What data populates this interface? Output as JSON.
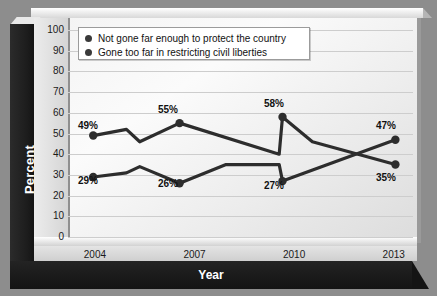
{
  "chart_data": {
    "type": "line",
    "title": "",
    "xlabel": "Year",
    "ylabel": "Percent",
    "ylim": [
      0,
      100
    ],
    "ytick_labels": [
      "100",
      "90",
      "80",
      "70",
      "60",
      "50",
      "40",
      "30",
      "20",
      "10",
      "0"
    ],
    "categories": [
      "2004",
      "2007",
      "2010",
      "2013"
    ],
    "grid": "horizontal",
    "legend_position": "top-left",
    "series": [
      {
        "name": "Not gone far enough to protect the country",
        "color": "#2d2d2d",
        "labeled_values": [
          49,
          55,
          58,
          35
        ],
        "labels": [
          "49%",
          "55%",
          "58%",
          "35%"
        ],
        "points": [
          {
            "x": 2004.3,
            "y": 49
          },
          {
            "x": 2005.3,
            "y": 52
          },
          {
            "x": 2005.7,
            "y": 46
          },
          {
            "x": 2006.9,
            "y": 55
          },
          {
            "x": 2009.9,
            "y": 40
          },
          {
            "x": 2010.0,
            "y": 58
          },
          {
            "x": 2010.9,
            "y": 46
          },
          {
            "x": 2013.4,
            "y": 35
          }
        ]
      },
      {
        "name": "Gone too far in restricting civil liberties",
        "color": "#2d2d2d",
        "labeled_values": [
          29,
          26,
          27,
          47
        ],
        "labels": [
          "29%",
          "26%",
          "27%",
          "47%"
        ],
        "points": [
          {
            "x": 2004.3,
            "y": 29
          },
          {
            "x": 2005.3,
            "y": 31
          },
          {
            "x": 2005.7,
            "y": 34
          },
          {
            "x": 2006.9,
            "y": 26
          },
          {
            "x": 2008.3,
            "y": 35
          },
          {
            "x": 2009.9,
            "y": 35
          },
          {
            "x": 2010.0,
            "y": 27
          },
          {
            "x": 2013.4,
            "y": 47
          }
        ]
      }
    ]
  },
  "legend": {
    "items": [
      {
        "label": "Not gone far enough to protect the country"
      },
      {
        "label": "Gone too far in restricting civil liberties"
      }
    ]
  },
  "axes": {
    "y_title": "Percent",
    "x_title": "Year"
  },
  "data_labels": {
    "upper": [
      {
        "text": "49%",
        "left": 78,
        "top": 120
      },
      {
        "text": "55%",
        "left": 158,
        "top": 104
      },
      {
        "text": "58%",
        "left": 264,
        "top": 98
      },
      {
        "text": "47%",
        "left": 376,
        "top": 120
      }
    ],
    "lower": [
      {
        "text": "29%",
        "left": 78,
        "top": 175
      },
      {
        "text": "26%",
        "left": 158,
        "top": 178
      },
      {
        "text": "27%",
        "left": 264,
        "top": 180
      },
      {
        "text": "35%",
        "left": 376,
        "top": 172
      }
    ]
  },
  "colors": {
    "line": "#2d2d2d",
    "frame_dark": "#1d1d1d",
    "panel_light": "#f7f7f7",
    "gridline": "#cdcdcd",
    "page_bg": "#8d8d8d"
  }
}
